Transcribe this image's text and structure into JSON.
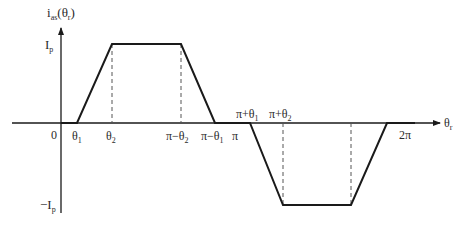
{
  "diagram": {
    "y_axis_label": {
      "main": "i",
      "sub": "as",
      "arg_open": "(θ",
      "arg_sub": "r",
      "arg_close": ")"
    },
    "x_axis_label": {
      "main": "θ",
      "sub": "r"
    },
    "levels": {
      "positive": {
        "main": "I",
        "sub": "p"
      },
      "negative": {
        "main": "−I",
        "sub": "p"
      }
    },
    "origin_label": "0",
    "ticks": [
      {
        "main": "θ",
        "sub": "1"
      },
      {
        "main": "θ",
        "sub": "2"
      },
      {
        "main": "π−θ",
        "sub": "2"
      },
      {
        "main": "π−θ",
        "sub": "1"
      },
      {
        "main": "π",
        "sub": ""
      },
      {
        "main": "π+θ",
        "sub": "1"
      },
      {
        "main": "π+θ",
        "sub": "2"
      },
      {
        "main": "2π",
        "sub": ""
      }
    ],
    "waveform": "trapezoidal",
    "colors": {
      "line": "#1a1a1a",
      "dashed": "#555555",
      "text": "#2a2a2a"
    }
  }
}
